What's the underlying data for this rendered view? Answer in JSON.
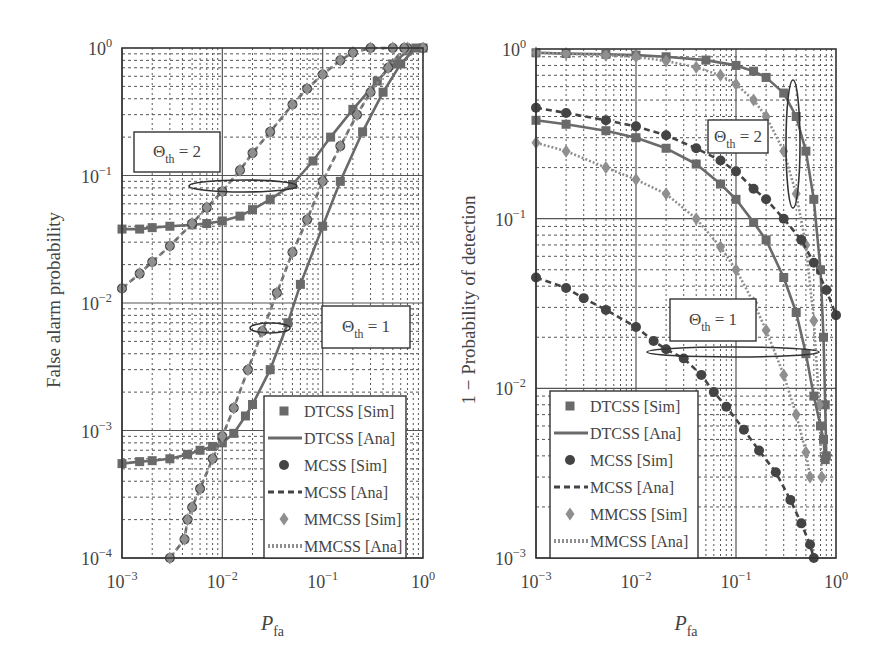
{
  "figure": {
    "colors": {
      "dark": "#444444",
      "mid": "#6a6a6a",
      "light": "#8f8f8f",
      "grid": "#555555",
      "background": "#ffffff"
    }
  },
  "chart_data": [
    {
      "type": "line",
      "panel": "left",
      "title": "",
      "xlabel": "P_fa",
      "xlabel_main": "P",
      "xlabel_sub": "fa",
      "ylabel": "False alarm probability",
      "xscale": "log",
      "yscale": "log",
      "xlim": [
        0.001,
        1
      ],
      "ylim": [
        0.0001,
        1
      ],
      "xticks": [
        {
          "base": "10",
          "exp": "−3"
        },
        {
          "base": "10",
          "exp": "−2"
        },
        {
          "base": "10",
          "exp": "−1"
        },
        {
          "base": "10",
          "exp": "0"
        }
      ],
      "yticks": [
        {
          "base": "10",
          "exp": "0"
        },
        {
          "base": "10",
          "exp": "−1"
        },
        {
          "base": "10",
          "exp": "−2"
        },
        {
          "base": "10",
          "exp": "−3"
        },
        {
          "base": "10",
          "exp": "−4"
        }
      ],
      "grid": true,
      "legend_position": "lower right",
      "annotations": [
        {
          "label_main": "Θ",
          "label_sub": "th",
          "label_rest": " = 2",
          "text": "Θth = 2"
        },
        {
          "label_main": "Θ",
          "label_sub": "th",
          "label_rest": " = 1",
          "text": "Θth = 1"
        }
      ],
      "series": [
        {
          "name": "DTCSS [Sim]/[Ana] Θth=2",
          "style": "solid-square",
          "x": [
            0.001,
            0.0015,
            0.002,
            0.003,
            0.005,
            0.007,
            0.01,
            0.015,
            0.02,
            0.03,
            0.05,
            0.08,
            0.12,
            0.2,
            0.35,
            0.5,
            0.7,
            1.0
          ],
          "y": [
            0.038,
            0.038,
            0.039,
            0.04,
            0.041,
            0.042,
            0.044,
            0.048,
            0.054,
            0.065,
            0.085,
            0.13,
            0.2,
            0.33,
            0.55,
            0.75,
            0.95,
            1.0
          ]
        },
        {
          "name": "MCSS/MMCSS Θth=2",
          "style": "dashed-circle-diamond",
          "x": [
            0.001,
            0.0015,
            0.002,
            0.003,
            0.005,
            0.007,
            0.01,
            0.015,
            0.02,
            0.03,
            0.05,
            0.07,
            0.1,
            0.15,
            0.2,
            0.3,
            0.5,
            0.7,
            1.0
          ],
          "y": [
            0.013,
            0.017,
            0.021,
            0.028,
            0.042,
            0.056,
            0.075,
            0.11,
            0.15,
            0.22,
            0.36,
            0.48,
            0.62,
            0.8,
            0.92,
            1.0,
            1.0,
            1.0,
            1.0
          ]
        },
        {
          "name": "DTCSS [Sim]/[Ana] Θth=1",
          "style": "solid-square",
          "x": [
            0.001,
            0.0015,
            0.002,
            0.003,
            0.0045,
            0.006,
            0.008,
            0.01,
            0.013,
            0.017,
            0.02,
            0.03,
            0.045,
            0.06,
            0.1,
            0.15,
            0.25,
            0.4,
            0.6,
            0.85
          ],
          "y": [
            0.00055,
            0.00057,
            0.00058,
            0.0006,
            0.00065,
            0.0007,
            0.00075,
            0.0008,
            0.00095,
            0.0013,
            0.0016,
            0.003,
            0.007,
            0.014,
            0.04,
            0.09,
            0.22,
            0.45,
            0.75,
            1.0
          ]
        },
        {
          "name": "MCSS/MMCSS Θth=1",
          "style": "dashed-circle-diamond",
          "x": [
            0.003,
            0.0042,
            0.0045,
            0.005,
            0.006,
            0.008,
            0.01,
            0.013,
            0.018,
            0.025,
            0.035,
            0.05,
            0.07,
            0.1,
            0.15,
            0.22,
            0.3,
            0.45,
            0.65
          ],
          "y": [
            0.0001,
            0.00014,
            0.0002,
            0.00025,
            0.00035,
            0.0006,
            0.0009,
            0.0015,
            0.003,
            0.006,
            0.012,
            0.025,
            0.045,
            0.09,
            0.17,
            0.3,
            0.45,
            0.7,
            1.0
          ]
        }
      ]
    },
    {
      "type": "line",
      "panel": "right",
      "title": "",
      "xlabel": "P_fa",
      "xlabel_main": "P",
      "xlabel_sub": "fa",
      "ylabel": "1 − Probability of detection",
      "xscale": "log",
      "yscale": "log",
      "xlim": [
        0.001,
        1
      ],
      "ylim": [
        0.001,
        1
      ],
      "xticks": [
        {
          "base": "10",
          "exp": "−3"
        },
        {
          "base": "10",
          "exp": "−2"
        },
        {
          "base": "10",
          "exp": "−1"
        },
        {
          "base": "10",
          "exp": "0"
        }
      ],
      "yticks": [
        {
          "base": "10",
          "exp": "0"
        },
        {
          "base": "10",
          "exp": "−1"
        },
        {
          "base": "10",
          "exp": "−2"
        },
        {
          "base": "10",
          "exp": "−3"
        }
      ],
      "grid": true,
      "legend_position": "lower left",
      "annotations": [
        {
          "label_main": "Θ",
          "label_sub": "th",
          "label_rest": " = 2",
          "text": "Θth = 2"
        },
        {
          "label_main": "Θ",
          "label_sub": "th",
          "label_rest": " = 1",
          "text": "Θth = 1"
        }
      ],
      "series": [
        {
          "name": "DTCSS Θth=2",
          "style": "solid-square",
          "x": [
            0.001,
            0.002,
            0.005,
            0.01,
            0.02,
            0.05,
            0.1,
            0.15,
            0.2,
            0.3,
            0.4,
            0.5,
            0.6,
            0.7,
            0.75,
            0.78,
            0.8
          ],
          "y": [
            0.95,
            0.94,
            0.93,
            0.92,
            0.9,
            0.86,
            0.8,
            0.74,
            0.68,
            0.55,
            0.4,
            0.25,
            0.13,
            0.05,
            0.02,
            0.008,
            0.004
          ]
        },
        {
          "name": "MMCSS Θth=2",
          "style": "dotted-diamond",
          "x": [
            0.001,
            0.002,
            0.005,
            0.01,
            0.02,
            0.04,
            0.07,
            0.1,
            0.15,
            0.2,
            0.3,
            0.4,
            0.5,
            0.6,
            0.68,
            0.72
          ],
          "y": [
            0.95,
            0.94,
            0.92,
            0.9,
            0.85,
            0.78,
            0.7,
            0.62,
            0.5,
            0.4,
            0.25,
            0.14,
            0.07,
            0.025,
            0.008,
            0.003
          ]
        },
        {
          "name": "MCSS Θth=1 (upper)",
          "style": "dashed-circle",
          "x": [
            0.001,
            0.002,
            0.005,
            0.01,
            0.02,
            0.04,
            0.07,
            0.1,
            0.15,
            0.2,
            0.3,
            0.45,
            0.6,
            0.8,
            1.0
          ],
          "y": [
            0.45,
            0.42,
            0.38,
            0.35,
            0.31,
            0.26,
            0.22,
            0.19,
            0.15,
            0.13,
            0.1,
            0.075,
            0.055,
            0.038,
            0.027
          ]
        },
        {
          "name": "DTCSS Θth=1",
          "style": "solid-square",
          "x": [
            0.001,
            0.002,
            0.005,
            0.01,
            0.02,
            0.04,
            0.07,
            0.1,
            0.15,
            0.2,
            0.3,
            0.4,
            0.5,
            0.6,
            0.7,
            0.75,
            0.78
          ],
          "y": [
            0.38,
            0.36,
            0.33,
            0.3,
            0.26,
            0.21,
            0.16,
            0.13,
            0.095,
            0.075,
            0.045,
            0.028,
            0.016,
            0.009,
            0.006,
            0.005,
            0.0038
          ]
        },
        {
          "name": "MMCSS Θth=1",
          "style": "dotted-diamond",
          "x": [
            0.001,
            0.002,
            0.005,
            0.01,
            0.02,
            0.04,
            0.07,
            0.1,
            0.15,
            0.2,
            0.3,
            0.4,
            0.5,
            0.55
          ],
          "y": [
            0.28,
            0.25,
            0.2,
            0.17,
            0.14,
            0.1,
            0.068,
            0.05,
            0.032,
            0.022,
            0.012,
            0.007,
            0.0042,
            0.003
          ]
        },
        {
          "name": "MCSS Θth=1 (lower)",
          "style": "dashed-circle",
          "x": [
            0.001,
            0.002,
            0.003,
            0.005,
            0.01,
            0.015,
            0.02,
            0.03,
            0.045,
            0.06,
            0.08,
            0.12,
            0.17,
            0.25,
            0.35,
            0.45,
            0.55,
            0.6
          ],
          "y": [
            0.045,
            0.039,
            0.034,
            0.029,
            0.023,
            0.019,
            0.017,
            0.015,
            0.012,
            0.0095,
            0.0078,
            0.0057,
            0.0043,
            0.0032,
            0.0022,
            0.0016,
            0.0012,
            0.001
          ]
        }
      ]
    }
  ],
  "legend": {
    "entries": [
      {
        "label": "DTCSS [Sim]",
        "marker": "square"
      },
      {
        "label": "DTCSS [Ana]",
        "marker": "solid-line"
      },
      {
        "label": "MCSS [Sim]",
        "marker": "circle"
      },
      {
        "label": "MCSS [Ana]",
        "marker": "dashed-line"
      },
      {
        "label": "MMCSS [Sim]",
        "marker": "diamond"
      },
      {
        "label": "MMCSS [Ana]",
        "marker": "dotted-line"
      }
    ]
  }
}
